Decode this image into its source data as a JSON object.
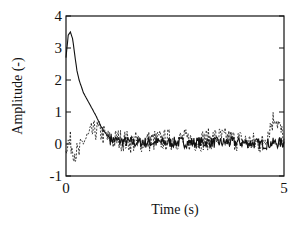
{
  "chart_data": {
    "type": "line",
    "title": "",
    "xlabel": "Time (s)",
    "ylabel": "Amplitude (-)",
    "xlim": [
      0,
      5
    ],
    "ylim": [
      -1,
      4
    ],
    "x_ticks": [
      0,
      5
    ],
    "x_tick_labels": [
      "0",
      "5"
    ],
    "y_ticks": [
      -1,
      0,
      1,
      2,
      3,
      4
    ],
    "y_tick_labels": [
      "-1",
      "0",
      "1",
      "2",
      "3",
      "4"
    ],
    "grid": false,
    "legend": null,
    "series": [
      {
        "name": "solid",
        "style": "solid",
        "x": [
          0,
          0.05,
          0.1,
          0.15,
          0.2,
          0.25,
          0.3,
          0.35,
          0.4,
          0.5,
          0.6,
          0.7,
          0.8,
          0.9,
          1.0,
          1.1,
          1.2,
          1.5,
          2.0,
          2.5,
          3.0,
          3.5,
          4.0,
          4.5,
          5.0
        ],
        "values": [
          2.7,
          3.4,
          3.5,
          3.3,
          2.8,
          2.3,
          2.0,
          1.8,
          1.6,
          1.35,
          1.1,
          0.85,
          0.55,
          0.35,
          0.2,
          0.12,
          0.1,
          0.05,
          0.05,
          0.05,
          0.05,
          0.05,
          0.05,
          0.0,
          0.05
        ]
      },
      {
        "name": "dashed",
        "style": "dashed",
        "x": [
          0,
          0.1,
          0.2,
          0.3,
          0.4,
          0.5,
          0.6,
          0.7,
          0.8,
          0.9,
          1.0,
          1.2,
          1.5,
          2.0,
          2.5,
          3.0,
          3.5,
          4.0,
          4.5,
          4.8,
          5.0
        ],
        "values": [
          0.0,
          0.05,
          -0.25,
          -0.3,
          0.1,
          0.2,
          0.35,
          0.45,
          0.35,
          0.25,
          0.1,
          0.15,
          0.05,
          0.1,
          0.15,
          0.1,
          0.2,
          0.1,
          0.0,
          0.9,
          0.1
        ]
      }
    ]
  }
}
